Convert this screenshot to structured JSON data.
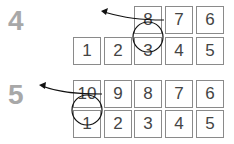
{
  "panels": [
    {
      "step_label": "4",
      "top_row": [
        "8",
        "7",
        "6"
      ],
      "bottom_row": [
        "1",
        "2",
        "3",
        "4",
        "5"
      ]
    },
    {
      "step_label": "5",
      "top_row": [
        "10",
        "9",
        "8",
        "7",
        "6"
      ],
      "bottom_row": [
        "1",
        "2",
        "3",
        "4",
        "5"
      ]
    }
  ]
}
